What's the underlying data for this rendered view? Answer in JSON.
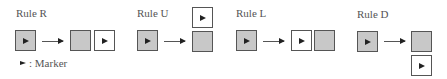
{
  "rules": [
    {
      "id": "R",
      "title": "Rule R"
    },
    {
      "id": "U",
      "title": "Rule U"
    },
    {
      "id": "L",
      "title": "Rule L"
    },
    {
      "id": "D",
      "title": "Rule D"
    }
  ],
  "legend": {
    "symbol": "marker-arrowhead",
    "label": ": Marker"
  },
  "colors": {
    "filled_cell": "#c8c8c8",
    "empty_cell": "#ffffff",
    "border": "#555555",
    "marker": "#222222"
  }
}
